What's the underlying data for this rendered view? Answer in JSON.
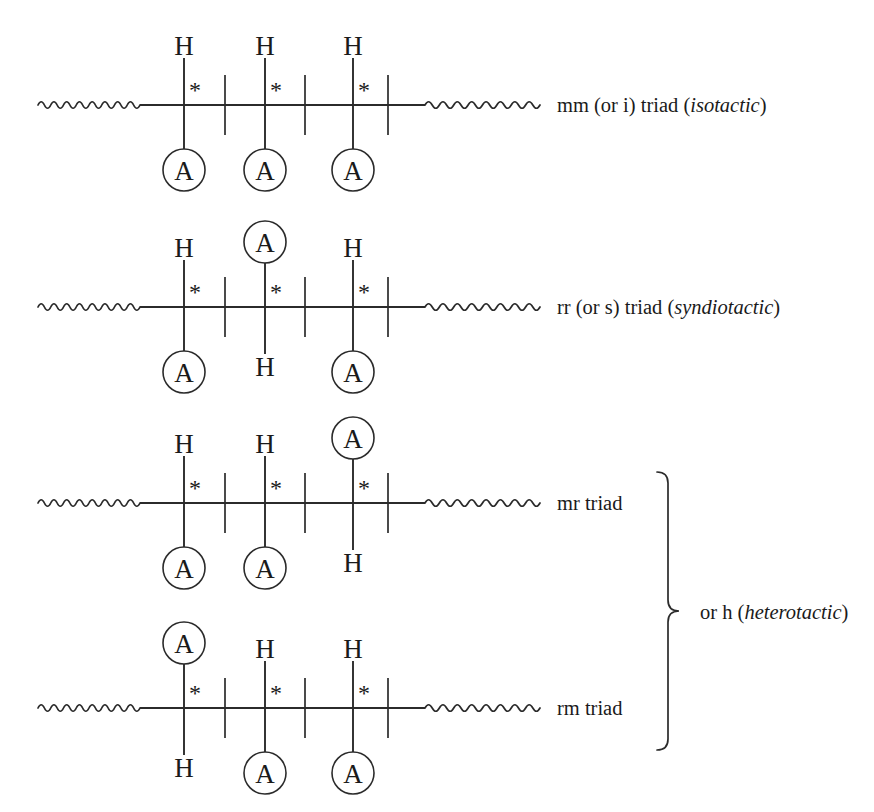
{
  "figure": {
    "background_color": "#ffffff",
    "ink_color": "#2b2b2b",
    "width": 874,
    "height": 812
  },
  "geometry": {
    "stereocenter_x": [
      184,
      265,
      353
    ],
    "ch2_x": [
      225,
      305,
      388
    ],
    "backbone_y": [
      105,
      307,
      503,
      708
    ],
    "backbone_x_start": 140,
    "backbone_x_end": 425,
    "squiggle_left_start": 38,
    "squiggle_left_end": 140,
    "squiggle_right_start": 425,
    "squiggle_right_end": 540,
    "substituent_bond_length": 46,
    "circle_radius": 21,
    "ch2_half_height": 30
  },
  "symbols": {
    "hydrogen": "H",
    "substituent": "A",
    "stereocenter_marker": "*"
  },
  "rows": [
    {
      "id": "mm-triad",
      "name": "isotactic",
      "label_plain": "mm (or i) triad (",
      "label_italic": "isotactic",
      "label_tail": ")",
      "label_x": 557,
      "label_y": 95,
      "units": [
        {
          "up": "H",
          "down": "A"
        },
        {
          "up": "H",
          "down": "A"
        },
        {
          "up": "H",
          "down": "A"
        }
      ]
    },
    {
      "id": "rr-triad",
      "name": "syndiotactic",
      "label_plain": "rr (or s) triad (",
      "label_italic": "syndiotactic",
      "label_tail": ")",
      "label_x": 557,
      "label_y": 297,
      "units": [
        {
          "up": "H",
          "down": "A"
        },
        {
          "up": "A",
          "down": "H"
        },
        {
          "up": "H",
          "down": "A"
        }
      ]
    },
    {
      "id": "mr-triad",
      "name": "heterotactic",
      "label_plain": "mr triad",
      "label_italic": "",
      "label_tail": "",
      "label_x": 557,
      "label_y": 493,
      "units": [
        {
          "up": "H",
          "down": "A"
        },
        {
          "up": "H",
          "down": "A"
        },
        {
          "up": "A",
          "down": "H"
        }
      ]
    },
    {
      "id": "rm-triad",
      "name": "heterotactic",
      "label_plain": "rm triad",
      "label_italic": "",
      "label_tail": "",
      "label_x": 557,
      "label_y": 698,
      "units": [
        {
          "up": "A",
          "down": "H"
        },
        {
          "up": "H",
          "down": "A"
        },
        {
          "up": "H",
          "down": "A"
        }
      ]
    }
  ],
  "group_bracket": {
    "label_plain": "or h (",
    "label_italic": "heterotactic",
    "label_tail": ")",
    "label_x": 700,
    "label_y": 602,
    "brace_x": 668,
    "brace_top": 472,
    "brace_bottom": 750,
    "brace_tip_y": 611,
    "spans_rows": [
      "mr-triad",
      "rm-triad"
    ]
  }
}
